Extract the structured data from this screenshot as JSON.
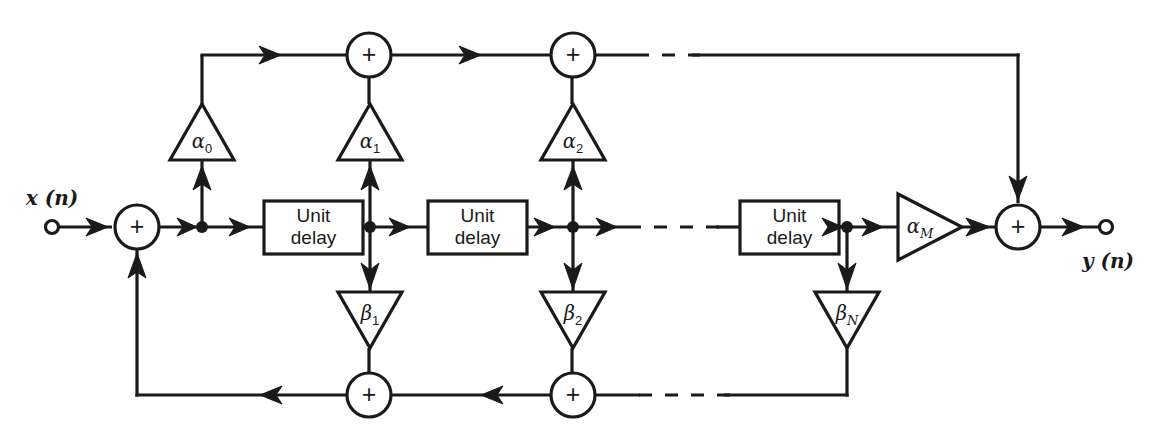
{
  "diagram": {
    "type": "signal-flow-block-diagram",
    "colors": {
      "line": "#1a1a1a",
      "background": "#ffffff",
      "fill": "#ffffff"
    },
    "io": {
      "input_label": "x (n)",
      "output_label": "y (n)"
    },
    "operators": {
      "adder_symbol": "+"
    },
    "delay_blocks": [
      {
        "line1": "Unit",
        "line2": "delay"
      },
      {
        "line1": "Unit",
        "line2": "delay"
      },
      {
        "line1": "Unit",
        "line2": "delay"
      }
    ],
    "feedforward_gains": [
      {
        "symbol": "α",
        "subscript": "0",
        "label": "α₀"
      },
      {
        "symbol": "α",
        "subscript": "1",
        "label": "α₁"
      },
      {
        "symbol": "α",
        "subscript": "2",
        "label": "α₂"
      },
      {
        "symbol": "α",
        "subscript": "M",
        "label": "αₘ"
      }
    ],
    "feedback_gains": [
      {
        "symbol": "β",
        "subscript": "1",
        "label": "β₁"
      },
      {
        "symbol": "β",
        "subscript": "2",
        "label": "β₂"
      },
      {
        "symbol": "β",
        "subscript": "N",
        "label": "βₙ"
      }
    ],
    "adders": {
      "input_adder": "+",
      "top_adders": [
        "+",
        "+"
      ],
      "output_adder": "+",
      "bottom_adders": [
        "+",
        "+"
      ]
    },
    "ellipses": {
      "top_row": "· · ·",
      "middle_row": "· · ·",
      "bottom_row": "· · ·"
    }
  }
}
